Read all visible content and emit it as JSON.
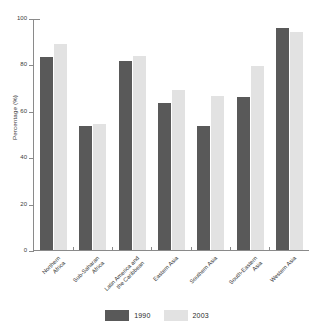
{
  "chart_data": {
    "type": "bar",
    "title": "",
    "xlabel": "",
    "ylabel": "Percentage (%)",
    "ylim": [
      0,
      100
    ],
    "yticks": [
      0,
      20,
      40,
      60,
      80,
      100
    ],
    "grid": false,
    "legend_position": "bottom",
    "categories": [
      "Northern\nAfrica",
      "Sub-Saharan\nAfrica",
      "Latin America and\nthe Caribbean",
      "Eastern Asia",
      "Southern Asia",
      "South-Eastern\nAsia",
      "Western Asia"
    ],
    "series": [
      {
        "name": "1990",
        "color": "#595959",
        "values": [
          83,
          53.5,
          81.5,
          63.5,
          53.5,
          66,
          95.5
        ]
      },
      {
        "name": "2003",
        "color": "#e2e2e2",
        "values": [
          89,
          54.5,
          83.5,
          69,
          66.5,
          79.5,
          94
        ]
      }
    ]
  },
  "axis": {
    "y_title": "Percentage (%)",
    "y_tick_labels": [
      "100",
      "80",
      "60",
      "40",
      "20",
      "0"
    ]
  },
  "legend": {
    "items": [
      {
        "label": "1990",
        "color": "#595959"
      },
      {
        "label": "2003",
        "color": "#e2e2e2"
      }
    ]
  }
}
